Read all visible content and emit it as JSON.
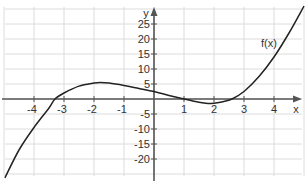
{
  "chart_data": {
    "type": "line",
    "title": "",
    "xlabel": "x",
    "ylabel": "y",
    "xlim": [
      -5,
      5
    ],
    "ylim": [
      -25,
      30
    ],
    "grid": true,
    "x_ticks": [
      -4,
      -3,
      -2,
      -1,
      1,
      2,
      3,
      4
    ],
    "y_ticks": [
      25,
      20,
      15,
      10,
      5,
      -5,
      -10,
      -15,
      -20
    ],
    "x_tick_labels": [
      "-4",
      "-3",
      "-2",
      "-1",
      "1",
      "2",
      "3",
      "4"
    ],
    "y_tick_labels": [
      "25",
      "20",
      "15",
      "10",
      "5",
      "-5",
      "-10",
      "-15",
      "-20"
    ],
    "series": [
      {
        "name": "f(x)",
        "x": [
          -4.97,
          -4.5,
          -4,
          -3.5,
          -3.3,
          -3,
          -2.5,
          -2,
          -1.8,
          -1.5,
          -1,
          -0.5,
          0,
          0.5,
          1,
          1.5,
          1.8,
          2,
          2.3,
          2.6,
          3,
          3.5,
          4,
          4.5,
          5
        ],
        "y": [
          -26.3,
          -17,
          -9.5,
          -3,
          0,
          2,
          4.3,
          5.3,
          5.5,
          5.3,
          4.5,
          3.5,
          2.5,
          1.2,
          0,
          -1.1,
          -1.5,
          -1.4,
          -0.9,
          0,
          2.5,
          7.5,
          14,
          22,
          31
        ]
      }
    ],
    "annotations": [
      {
        "text": "f(x)",
        "x": 4.1,
        "y": 18
      }
    ]
  }
}
